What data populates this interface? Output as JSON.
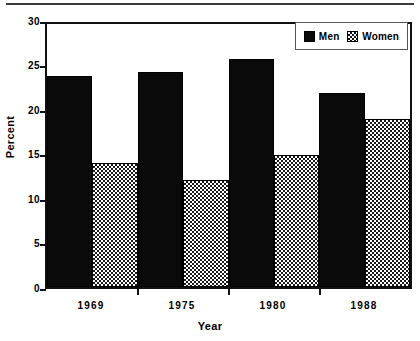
{
  "chart_data": {
    "type": "bar",
    "title": "",
    "xlabel": "Year",
    "ylabel": "Percent",
    "categories": [
      "1969",
      "1975",
      "1980",
      "1988"
    ],
    "series": [
      {
        "name": "Men",
        "values": [
          24.1,
          24.5,
          26.0,
          22.1
        ],
        "fill": "solid-black",
        "color": "#0a0a0a"
      },
      {
        "name": "Women",
        "values": [
          14.1,
          12.2,
          15.1,
          19.2
        ],
        "fill": "checkerboard",
        "color": "#1a1a1a"
      }
    ],
    "ylim": [
      0,
      30
    ],
    "yticks": [
      0,
      5,
      10,
      15,
      20,
      25,
      30
    ],
    "ytick_labels": [
      "0",
      "5",
      "10",
      "15",
      "20",
      "25",
      "30"
    ],
    "grid": false,
    "legend_position": "top-right",
    "frame": true
  },
  "legend": {
    "items": [
      {
        "label": "Men",
        "swatch": "solid-black-square"
      },
      {
        "label": "Women",
        "swatch": "checkered-square"
      }
    ]
  }
}
